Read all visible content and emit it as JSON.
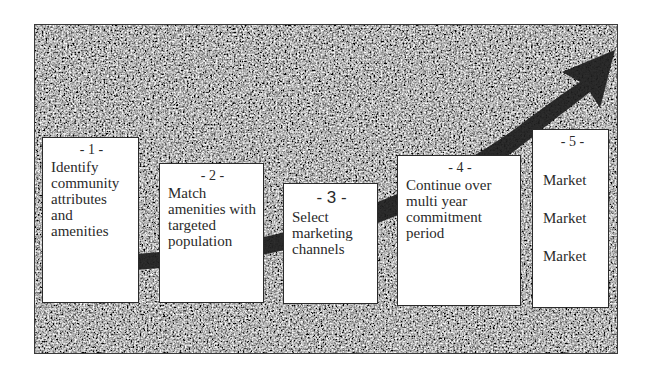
{
  "diagram": {
    "type": "process-flow-with-rising-arrow",
    "background_texture": "granite-noise",
    "colors": {
      "page_background": "#ffffff",
      "frame_texture_dark": "#2a2a2a",
      "frame_texture_light": "#bdbdbd",
      "arrow": "#1e1e1e",
      "box_fill": "#ffffff",
      "box_border": "#2b2b2b",
      "text": "#2a2a2a"
    },
    "arrow": {
      "icon": "rising-curved-arrow-icon",
      "direction": "up-right"
    },
    "steps": [
      {
        "number": "- 1 -",
        "text": "Identify\ncommunity\nattributes and\namenities"
      },
      {
        "number": "- 2 -",
        "text": "Match\namenities with\ntargeted\npopulation"
      },
      {
        "number": "- 3 -",
        "text": "Select\nmarketing\nchannels"
      },
      {
        "number": "- 4 -",
        "text": "Continue over\nmulti year\ncommitment\nperiod"
      },
      {
        "number": "- 5 -",
        "items": [
          "Market",
          "Market",
          "Market"
        ]
      }
    ]
  }
}
